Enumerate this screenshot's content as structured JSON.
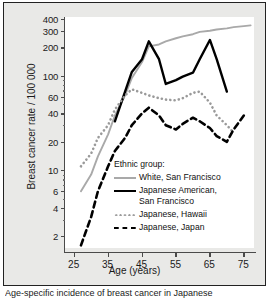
{
  "figure": {
    "caption": "Age-specific incidence of breast cancer in Japanese"
  },
  "chart_data": {
    "type": "line",
    "title": "",
    "xlabel": "Age (years)",
    "ylabel": "Breast cancer rate / 100 000",
    "yscale": "log",
    "ylim": [
      1.5,
      420
    ],
    "xlim": [
      22,
      78
    ],
    "grid": false,
    "legend_title": "Ethnic group:",
    "legend_position": "inside-lower-right",
    "xticks": [
      25,
      35,
      45,
      55,
      65,
      75
    ],
    "yticks": [
      2,
      4,
      6,
      10,
      20,
      40,
      60,
      100,
      200,
      300,
      400
    ],
    "yticks_minor": [
      3,
      5,
      7,
      8,
      9,
      30,
      50,
      70,
      80,
      90
    ],
    "series": [
      {
        "name": "White, San Francisco",
        "style": "solid",
        "color": "#a9a9a9",
        "x": [
          27,
          30,
          32,
          35,
          37,
          40,
          42,
          45,
          47,
          50,
          52,
          55,
          57,
          60,
          62,
          65,
          67,
          70,
          72,
          75,
          77
        ],
        "y": [
          6,
          9,
          14,
          24,
          38,
          62,
          95,
          140,
          205,
          215,
          232,
          250,
          262,
          276,
          292,
          300,
          310,
          318,
          328,
          336,
          342
        ]
      },
      {
        "name": "Japanese American, San Francisco",
        "style": "solid",
        "color": "#000000",
        "x": [
          37,
          40,
          42,
          45,
          47,
          50,
          52,
          55,
          57,
          60,
          62,
          65,
          67,
          70
        ],
        "y": [
          33,
          68,
          110,
          150,
          232,
          150,
          82,
          90,
          98,
          108,
          150,
          240,
          150,
          68
        ]
      },
      {
        "name": "Japanese, Hawaii",
        "style": "dotted",
        "color": "#9a9a9a",
        "x": [
          27,
          30,
          32,
          35,
          37,
          40,
          42,
          45,
          47,
          50,
          52,
          55,
          57,
          60,
          62,
          65,
          67,
          70,
          72
        ],
        "y": [
          11,
          15,
          22,
          30,
          44,
          62,
          72,
          66,
          62,
          58,
          56,
          55,
          58,
          66,
          68,
          52,
          38,
          30,
          25
        ]
      },
      {
        "name": "Japanese, Japan",
        "style": "dashed",
        "color": "#000000",
        "x": [
          27,
          30,
          32,
          35,
          37,
          40,
          42,
          45,
          47,
          50,
          52,
          55,
          57,
          60,
          62,
          65,
          67,
          70,
          72,
          75
        ],
        "y": [
          1.6,
          3.2,
          6,
          11,
          16,
          22,
          30,
          40,
          46,
          38,
          30,
          27,
          31,
          36,
          33,
          28,
          23,
          20,
          27,
          38
        ]
      }
    ]
  }
}
